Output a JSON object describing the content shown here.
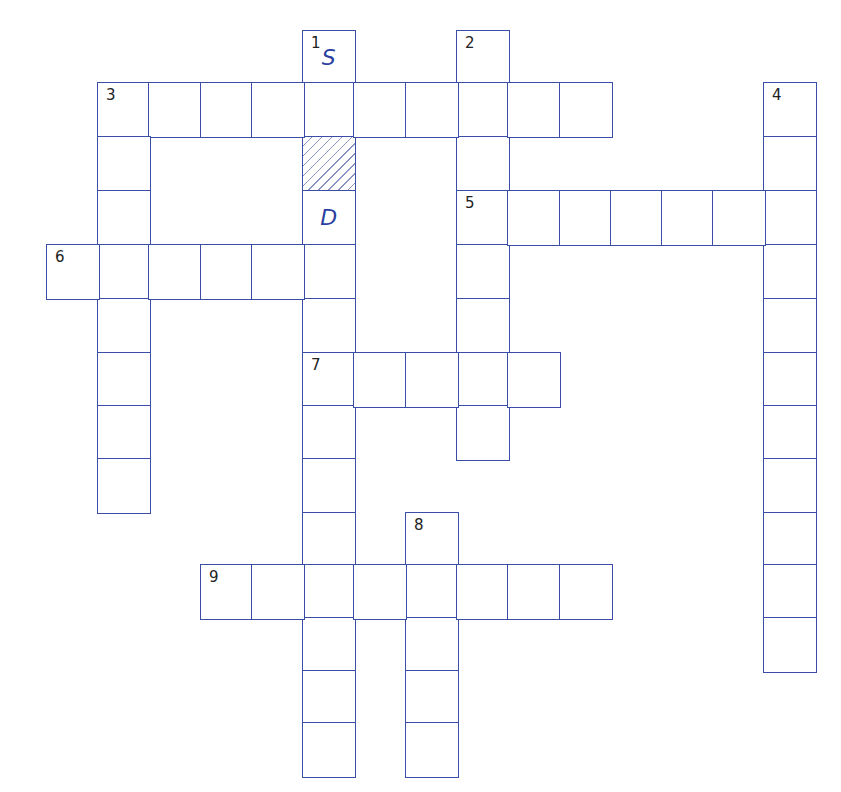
{
  "puzzle": {
    "type": "crossword",
    "colors": {
      "grid_line": "#3a4ea8",
      "letter": "#2b3fa0",
      "number": "#222222",
      "hatch": "#8a93c4"
    },
    "geometry": {
      "col_x": [
        46,
        97,
        148,
        200,
        251,
        302,
        353,
        405,
        456,
        507,
        559,
        610,
        661,
        712,
        763
      ],
      "row_y": [
        30,
        82,
        136,
        190,
        244,
        298,
        352,
        405,
        458,
        512,
        564,
        617,
        670,
        722
      ],
      "cell_w": 52,
      "cell_h": 54
    },
    "words": [
      {
        "number": "1",
        "direction": "down",
        "col": 5,
        "row": 0,
        "length": 14
      },
      {
        "number": "2",
        "direction": "down",
        "col": 8,
        "row": 0,
        "length": 8
      },
      {
        "number": "3",
        "direction": "across",
        "col": 1,
        "row": 1,
        "length": 10
      },
      {
        "number": "3",
        "direction": "down",
        "col": 1,
        "row": 1,
        "length": 8
      },
      {
        "number": "4",
        "direction": "down",
        "col": 14,
        "row": 1,
        "length": 11
      },
      {
        "number": "5",
        "direction": "across",
        "col": 8,
        "row": 3,
        "length": 7
      },
      {
        "number": "6",
        "direction": "across",
        "col": 0,
        "row": 4,
        "length": 6
      },
      {
        "number": "7",
        "direction": "across",
        "col": 5,
        "row": 6,
        "length": 5
      },
      {
        "number": "8",
        "direction": "down",
        "col": 7,
        "row": 9,
        "length": 5
      },
      {
        "number": "9",
        "direction": "across",
        "col": 3,
        "row": 10,
        "length": 8
      }
    ],
    "numbers": [
      {
        "label": "1",
        "col": 5,
        "row": 0
      },
      {
        "label": "2",
        "col": 8,
        "row": 0
      },
      {
        "label": "3",
        "col": 1,
        "row": 1
      },
      {
        "label": "4",
        "col": 14,
        "row": 1
      },
      {
        "label": "5",
        "col": 8,
        "row": 3
      },
      {
        "label": "6",
        "col": 0,
        "row": 4
      },
      {
        "label": "7",
        "col": 5,
        "row": 6
      },
      {
        "label": "8",
        "col": 7,
        "row": 9
      },
      {
        "label": "9",
        "col": 3,
        "row": 10
      }
    ],
    "filled_letters": [
      {
        "col": 5,
        "row": 0,
        "letter": "S"
      },
      {
        "col": 5,
        "row": 3,
        "letter": "D"
      }
    ],
    "hatched_cells": [
      {
        "col": 5,
        "row": 2
      }
    ]
  }
}
